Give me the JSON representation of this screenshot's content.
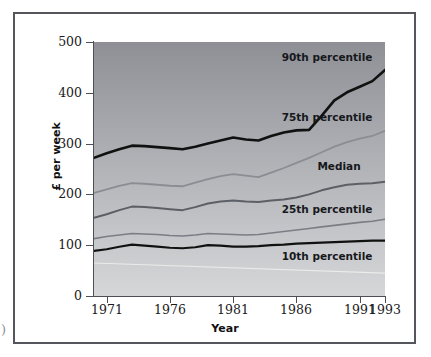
{
  "figure": {
    "cut_glyph": ")",
    "xtitle": "Year",
    "ytitle": "£ per week"
  },
  "chart_data": {
    "type": "line",
    "title": "",
    "xlabel": "Year",
    "ylabel": "£ per week",
    "xlim": [
      1970,
      1993
    ],
    "ylim": [
      0,
      500
    ],
    "grid": false,
    "legend_position": "inline-above-line",
    "yticks": [
      0,
      100,
      200,
      300,
      400,
      500
    ],
    "xticks": [
      1971,
      1976,
      1981,
      1986,
      1991,
      1993
    ],
    "x": [
      1970,
      1971,
      1972,
      1973,
      1974,
      1975,
      1976,
      1977,
      1978,
      1979,
      1980,
      1981,
      1982,
      1983,
      1984,
      1985,
      1986,
      1987,
      1988,
      1989,
      1990,
      1991,
      1992,
      1993
    ],
    "series": [
      {
        "name": "90th percentile",
        "color": "#111111",
        "width": 2.6,
        "label_x": 1988.4,
        "label_y": 470,
        "values": [
          272,
          281,
          289,
          296,
          295,
          293,
          291,
          289,
          294,
          300,
          306,
          312,
          308,
          306,
          315,
          322,
          326,
          327,
          355,
          385,
          401,
          412,
          423,
          445
        ]
      },
      {
        "name": "75th percentile",
        "color": "#8a8d93",
        "width": 1.8,
        "label_x": 1988.4,
        "label_y": 353,
        "values": [
          203,
          210,
          217,
          222,
          221,
          219,
          217,
          216,
          223,
          230,
          236,
          240,
          237,
          234,
          243,
          252,
          262,
          272,
          283,
          294,
          303,
          310,
          315,
          325
        ]
      },
      {
        "name": "Median",
        "color": "#5c5f66",
        "width": 2.0,
        "label_x": 1989.4,
        "label_y": 255,
        "values": [
          154,
          161,
          169,
          176,
          175,
          173,
          171,
          169,
          175,
          182,
          186,
          188,
          186,
          185,
          188,
          190,
          194,
          200,
          208,
          214,
          219,
          221,
          222,
          225
        ]
      },
      {
        "name": "25th percentile",
        "color": "#7a7d84",
        "width": 1.6,
        "label_x": 1988.4,
        "label_y": 172,
        "values": [
          113,
          117,
          120,
          123,
          122,
          121,
          119,
          118,
          120,
          123,
          122,
          121,
          120,
          121,
          124,
          127,
          130,
          133,
          136,
          139,
          142,
          145,
          147,
          151
        ]
      },
      {
        "name": "10th percentile",
        "color": "#111111",
        "width": 2.2,
        "label_x": 1988.4,
        "label_y": 78,
        "values": [
          89,
          92,
          97,
          101,
          99,
          97,
          95,
          94,
          96,
          100,
          99,
          97,
          97,
          98,
          100,
          101,
          103,
          104,
          105,
          106,
          107,
          108,
          109,
          109
        ]
      }
    ],
    "shading": {
      "description": "grey gradient background, dark at top to light at bottom",
      "top_color": "#8e9096",
      "bottom_color": "#d6d7d9"
    },
    "faint_guide": {
      "name": "faint-white-band-edge",
      "color": "#f0f0ee",
      "values_start": 65,
      "values_end": 45
    }
  }
}
